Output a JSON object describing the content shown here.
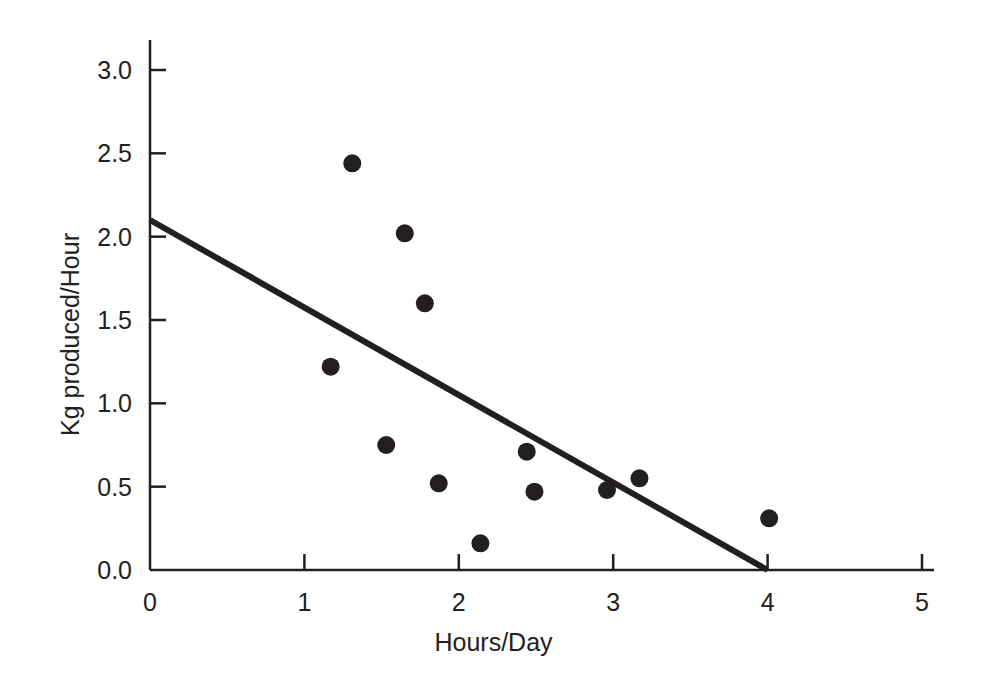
{
  "figure": {
    "background_color": "#ffffff",
    "ink_color": "#231f20",
    "marker_color": "#231f20",
    "trendline_color": "#231f20"
  },
  "axes": {
    "x_title": "Hours/Day",
    "y_title": "Kg produced/Hour",
    "x_ticks": [
      "0",
      "1",
      "2",
      "3",
      "4",
      "5"
    ],
    "y_ticks": [
      "0.0",
      "0.5",
      "1.0",
      "1.5",
      "2.0",
      "2.5",
      "3.0"
    ]
  },
  "chart_data": {
    "type": "scatter",
    "title": "",
    "xlabel": "Hours/Day",
    "ylabel": "Kg produced/Hour",
    "xlim": [
      0,
      5
    ],
    "ylim": [
      0.0,
      3.0
    ],
    "x_tick_values": [
      0,
      1,
      2,
      3,
      4,
      5
    ],
    "y_tick_values": [
      0.0,
      0.5,
      1.0,
      1.5,
      2.0,
      2.5,
      3.0
    ],
    "grid": false,
    "legend": null,
    "points": [
      {
        "x": 1.17,
        "y": 1.22
      },
      {
        "x": 1.31,
        "y": 2.44
      },
      {
        "x": 1.53,
        "y": 0.75
      },
      {
        "x": 1.65,
        "y": 2.02
      },
      {
        "x": 1.78,
        "y": 1.6
      },
      {
        "x": 1.87,
        "y": 0.52
      },
      {
        "x": 2.14,
        "y": 0.16
      },
      {
        "x": 2.44,
        "y": 0.71
      },
      {
        "x": 2.49,
        "y": 0.47
      },
      {
        "x": 2.96,
        "y": 0.48
      },
      {
        "x": 3.17,
        "y": 0.55
      },
      {
        "x": 4.01,
        "y": 0.31
      }
    ],
    "marker_radius_px": 9,
    "trendline": {
      "type": "linear-fit",
      "x_start": 0.0,
      "y_start": 2.1,
      "x_end": 4.0,
      "y_end": 0.0,
      "slope": -0.525,
      "intercept": 2.1,
      "width_px": 6
    }
  }
}
